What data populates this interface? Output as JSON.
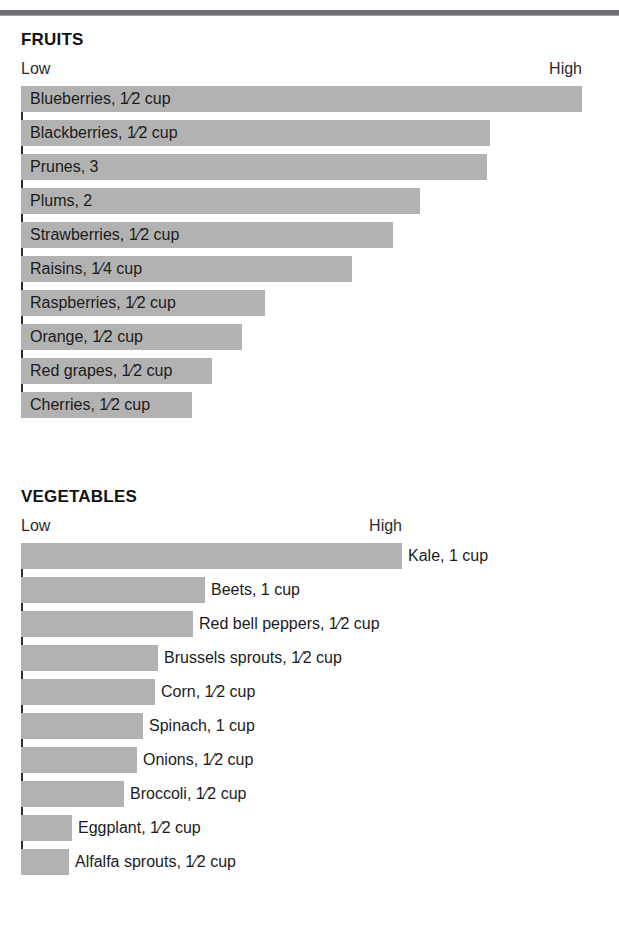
{
  "page": {
    "background": "#ffffff",
    "bar_color": "#b2b2b2",
    "axis_color": "#2e2e2e",
    "rule_color": "#6e7074"
  },
  "chart_data": [
    {
      "type": "bar",
      "orientation": "horizontal",
      "title": "FRUITS",
      "xlabel": "",
      "ylabel": "",
      "axis_low_label": "Low",
      "axis_high_label": "High",
      "label_placement": "inside-bar",
      "grid": false,
      "legend": "none",
      "xlim": [
        0,
        100
      ],
      "note": "Qualitative antioxidant ranking scale from Low to High; values are relative bar lengths read off the Low-High axis.",
      "categories": [
        "Blueberries, 1⁄2 cup",
        "Blackberries, 1⁄2 cup",
        "Prunes, 3",
        "Plums, 2",
        "Strawberries, 1⁄2 cup",
        "Raisins, 1⁄4 cup",
        "Raspberries, 1⁄2 cup",
        "Orange, 1⁄2 cup",
        "Red grapes, 1⁄2 cup",
        "Cherries, 1⁄2 cup"
      ],
      "values": [
        100,
        83.6,
        83.0,
        71.2,
        66.4,
        59.1,
        43.6,
        39.4,
        34.1,
        30.5
      ]
    },
    {
      "type": "bar",
      "orientation": "horizontal",
      "title": "VEGETABLES",
      "xlabel": "",
      "ylabel": "",
      "axis_low_label": "Low",
      "axis_high_label": "High",
      "label_placement": "outside-right",
      "grid": false,
      "legend": "none",
      "xlim": [
        0,
        100
      ],
      "note": "Qualitative antioxidant ranking scale from Low to High; values are relative bar lengths read off the Low-High axis.",
      "categories": [
        "Kale, 1 cup",
        "Beets, 1 cup",
        "Red bell peppers, 1⁄2 cup",
        "Brussels sprouts, 1⁄2 cup",
        "Corn, 1⁄2 cup",
        "Spinach, 1 cup",
        "Onions, 1⁄2 cup",
        "Broccoli, 1⁄2 cup",
        "Eggplant, 1⁄2 cup",
        "Alfalfa sprouts, 1⁄2 cup"
      ],
      "values": [
        100,
        48.3,
        45.1,
        36.0,
        35.2,
        32.0,
        30.4,
        27.0,
        13.4,
        12.6
      ]
    }
  ],
  "sections": [
    {
      "id": "fruits",
      "title": "FRUITS",
      "low": "Low",
      "high": "High",
      "rows": [
        {
          "label": "Blueberries, 1⁄2 cup",
          "width_px": 561
        },
        {
          "label": "Blackberries, 1⁄2 cup",
          "width_px": 469
        },
        {
          "label": "Prunes, 3",
          "width_px": 466
        },
        {
          "label": "Plums, 2",
          "width_px": 399
        },
        {
          "label": "Strawberries, 1⁄2 cup",
          "width_px": 372
        },
        {
          "label": "Raisins, 1⁄4 cup",
          "width_px": 331
        },
        {
          "label": "Raspberries, 1⁄2 cup",
          "width_px": 244
        },
        {
          "label": "Orange, 1⁄2 cup",
          "width_px": 221
        },
        {
          "label": "Red grapes, 1⁄2 cup",
          "width_px": 191
        },
        {
          "label": "Cherries, 1⁄2 cup",
          "width_px": 171
        }
      ]
    },
    {
      "id": "vegetables",
      "title": "VEGETABLES",
      "low": "Low",
      "high": "High",
      "rows": [
        {
          "label": "Kale, 1 cup",
          "width_px": 381
        },
        {
          "label": "Beets, 1 cup",
          "width_px": 184
        },
        {
          "label": "Red bell peppers, 1⁄2 cup",
          "width_px": 172
        },
        {
          "label": "Brussels sprouts, 1⁄2 cup",
          "width_px": 137
        },
        {
          "label": "Corn, 1⁄2 cup",
          "width_px": 134
        },
        {
          "label": "Spinach, 1 cup",
          "width_px": 122
        },
        {
          "label": "Onions, 1⁄2 cup",
          "width_px": 116
        },
        {
          "label": "Broccoli, 1⁄2 cup",
          "width_px": 103
        },
        {
          "label": "Eggplant, 1⁄2 cup",
          "width_px": 51
        },
        {
          "label": "Alfalfa sprouts, 1⁄2 cup",
          "width_px": 48
        }
      ]
    }
  ]
}
